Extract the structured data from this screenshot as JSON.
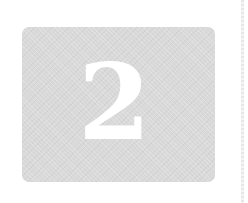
{
  "tile": {
    "numeral": "2",
    "background_color": "#d9d9d9",
    "numeral_color": "#ffffff"
  },
  "edge": {
    "color": "#e6e6e6"
  }
}
